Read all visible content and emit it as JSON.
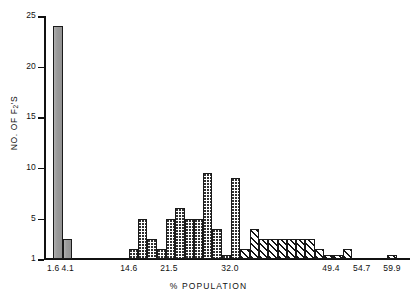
{
  "chart_data": {
    "type": "bar",
    "title": "",
    "xlabel": "% POPULATION",
    "ylabel": "NO. OF F2'S",
    "ylabel_prefix": "NO. OF F",
    "ylabel_sub": "2",
    "ylabel_suffix": "'S",
    "ylim": [
      1,
      25
    ],
    "yticks": [
      1,
      5,
      10,
      15,
      20,
      25
    ],
    "ytick_labels": [
      "1",
      "5",
      "10",
      "15",
      "20",
      "25"
    ],
    "xlim": [
      0.0,
      63.0
    ],
    "xticks": [
      1.6,
      4.1,
      14.6,
      21.5,
      32.0,
      49.4,
      54.7,
      59.9
    ],
    "xtick_labels": [
      "1.6",
      "4.1",
      "14.6",
      "21.5",
      "32.0",
      "49.4",
      "54.7",
      "59.9"
    ],
    "grid": false,
    "legend": false,
    "bin_width": 1.6,
    "series": [
      {
        "name": "parental / low",
        "fill": "solid",
        "color": "#9a9a9a",
        "bins": [
          {
            "x_left": 1.6,
            "value": 24
          },
          {
            "x_left": 3.2,
            "value": 3
          }
        ]
      },
      {
        "name": "intermediate",
        "fill": "dotted",
        "color": "#303030",
        "bins": [
          {
            "x_left": 14.6,
            "value": 2
          },
          {
            "x_left": 16.2,
            "value": 5
          },
          {
            "x_left": 17.8,
            "value": 3
          },
          {
            "x_left": 19.4,
            "value": 2
          },
          {
            "x_left": 21.0,
            "value": 5
          },
          {
            "x_left": 22.6,
            "value": 6
          },
          {
            "x_left": 24.2,
            "value": 5
          },
          {
            "x_left": 25.8,
            "value": 5
          },
          {
            "x_left": 27.4,
            "value": 9.5
          },
          {
            "x_left": 29.0,
            "value": 4
          },
          {
            "x_left": 30.6,
            "value": 1.4
          },
          {
            "x_left": 32.2,
            "value": 9
          }
        ]
      },
      {
        "name": "high",
        "fill": "hatch",
        "color": "#151515",
        "bins": [
          {
            "x_left": 33.8,
            "value": 2
          },
          {
            "x_left": 35.4,
            "value": 4
          },
          {
            "x_left": 37.0,
            "value": 3
          },
          {
            "x_left": 38.6,
            "value": 3
          },
          {
            "x_left": 40.2,
            "value": 3
          },
          {
            "x_left": 41.8,
            "value": 3
          },
          {
            "x_left": 43.4,
            "value": 3
          },
          {
            "x_left": 45.0,
            "value": 3
          },
          {
            "x_left": 46.6,
            "value": 2
          },
          {
            "x_left": 48.2,
            "value": 1.4
          },
          {
            "x_left": 49.8,
            "value": 1.4
          },
          {
            "x_left": 51.4,
            "value": 2
          },
          {
            "x_left": 59.1,
            "value": 1.4
          }
        ]
      }
    ]
  }
}
